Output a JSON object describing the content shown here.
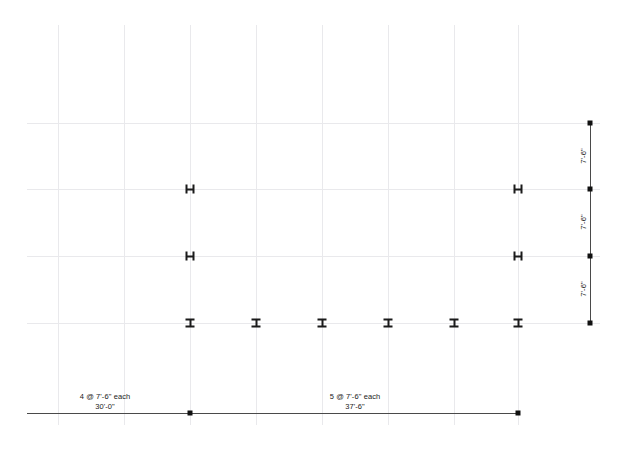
{
  "drawing": {
    "title": "Structural Framing Plan",
    "type": "steel-framing-grid-plan"
  },
  "canvas": {
    "width": 627,
    "height": 452,
    "background": "#ffffff"
  },
  "colors": {
    "gridline": "#e9e9ec",
    "dimension_line": "#4a4a4a",
    "dimension_dot": "#111111",
    "column_marker": "#1b1b1b",
    "text": "#1a1a1a"
  },
  "grid": {
    "vertical_lines": [
      {
        "x": 58,
        "y1": 25,
        "y2": 425
      },
      {
        "x": 124,
        "y1": 25,
        "y2": 425
      },
      {
        "x": 190,
        "y1": 25,
        "y2": 425
      },
      {
        "x": 256,
        "y1": 25,
        "y2": 425
      },
      {
        "x": 322,
        "y1": 25,
        "y2": 425
      },
      {
        "x": 388,
        "y1": 25,
        "y2": 425
      },
      {
        "x": 454,
        "y1": 25,
        "y2": 425
      },
      {
        "x": 518,
        "y1": 25,
        "y2": 425
      }
    ],
    "horizontal_lines": [
      {
        "y": 123,
        "x1": 27,
        "x2": 600
      },
      {
        "y": 189,
        "x1": 27,
        "x2": 600
      },
      {
        "y": 256,
        "x1": 27,
        "x2": 600
      },
      {
        "y": 323,
        "x1": 27,
        "x2": 600
      }
    ]
  },
  "columns": [
    {
      "x": 190,
      "y": 189,
      "orientation": "h",
      "label": "wide-flange-column"
    },
    {
      "x": 518,
      "y": 189,
      "orientation": "h",
      "label": "wide-flange-column"
    },
    {
      "x": 190,
      "y": 256,
      "orientation": "h",
      "label": "wide-flange-column"
    },
    {
      "x": 518,
      "y": 256,
      "orientation": "h",
      "label": "wide-flange-column"
    },
    {
      "x": 190,
      "y": 323,
      "orientation": "i",
      "label": "wide-flange-column"
    },
    {
      "x": 256,
      "y": 323,
      "orientation": "i",
      "label": "wide-flange-column"
    },
    {
      "x": 322,
      "y": 323,
      "orientation": "i",
      "label": "wide-flange-column"
    },
    {
      "x": 388,
      "y": 323,
      "orientation": "i",
      "label": "wide-flange-column"
    },
    {
      "x": 454,
      "y": 323,
      "orientation": "i",
      "label": "wide-flange-column"
    },
    {
      "x": 518,
      "y": 323,
      "orientation": "i",
      "label": "wide-flange-column"
    }
  ],
  "dimensions": {
    "horizontal": {
      "line": {
        "y": 413,
        "x1": 27,
        "x2": 518
      },
      "dots": [
        {
          "x": 190,
          "y": 413
        },
        {
          "x": 518,
          "y": 413
        }
      ],
      "labels": [
        {
          "x": 105,
          "y_top": 392,
          "y_bottom": 402,
          "count_text": "4 @ 7'-6\" each",
          "total_text": "30'-0\""
        },
        {
          "x": 355,
          "y_top": 392,
          "y_bottom": 402,
          "count_text": "5 @ 7'-6\" each",
          "total_text": "37'-6\""
        }
      ]
    },
    "vertical": {
      "line": {
        "x": 590,
        "y1": 123,
        "y2": 323
      },
      "dots": [
        {
          "x": 590,
          "y": 123
        },
        {
          "x": 590,
          "y": 189
        },
        {
          "x": 590,
          "y": 256
        },
        {
          "x": 590,
          "y": 323
        }
      ],
      "labels": [
        {
          "x": 583,
          "y": 156,
          "text": "7'-6\""
        },
        {
          "x": 583,
          "y": 222,
          "text": "7'-6\""
        },
        {
          "x": 583,
          "y": 289,
          "text": "7'-6\""
        }
      ]
    }
  }
}
